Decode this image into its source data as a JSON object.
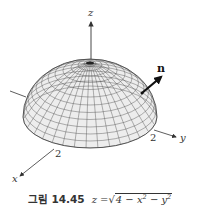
{
  "figure": {
    "type": "3d-surface-hemisphere",
    "surface_equation": "z = sqrt(4 - x^2 - y^2)",
    "radius": 2,
    "axes": {
      "x": {
        "label": "x",
        "tick": "2"
      },
      "y": {
        "label": "y",
        "tick": "2"
      },
      "z": {
        "label": "z"
      }
    },
    "normal_vector": {
      "label": "n"
    },
    "colors": {
      "surface_fill": "#ededed",
      "mesh_line": "#555555",
      "axis": "#333333",
      "arrow": "#111111"
    }
  },
  "caption": {
    "figure_number": "그림 14.45",
    "eq_lhs": "z =",
    "sqrt_symbol": "√",
    "radicand": [
      "4 − x",
      "2",
      " − y",
      "2"
    ]
  }
}
